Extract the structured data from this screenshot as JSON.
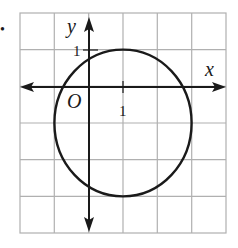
{
  "bullet": "•",
  "graph": {
    "grid": {
      "cols": 6,
      "rows": 6,
      "x_min": -2,
      "x_max": 4,
      "y_min": -4,
      "y_max": 2
    },
    "axes": {
      "x_label": "x",
      "y_label": "y",
      "origin_label": "O",
      "x_tick_label": "1",
      "y_tick_label": "1"
    },
    "circle": {
      "center": [
        1,
        -1
      ],
      "radius": 2
    },
    "colors": {
      "grid": "#b0b0b0",
      "axis": "#1a1a1a",
      "curve": "#1a1a1a",
      "background": "#ffffff"
    }
  }
}
